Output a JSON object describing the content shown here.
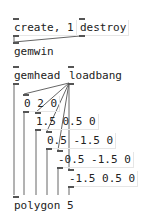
{
  "canvas": {
    "background": "#ffffff",
    "wire_color": "#666666"
  },
  "messages": {
    "create": "create, 1",
    "destroy": "destroy",
    "v0": "0 2 0",
    "v1": "1.5 0.5 0",
    "v2": "0.5 -1.5 0",
    "v3": "-0.5 -1.5 0",
    "v4": "-1.5 0.5 0"
  },
  "objects": {
    "gemwin": "gemwin",
    "gemhead": "gemhead",
    "loadbang": "loadbang",
    "polygon": "polygon 5"
  }
}
